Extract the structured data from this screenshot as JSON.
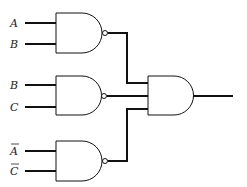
{
  "diagram": {
    "type": "logic-circuit",
    "gates": [
      {
        "id": "g1",
        "type": "NAND",
        "inputs": [
          "A",
          "B"
        ]
      },
      {
        "id": "g2",
        "type": "NAND",
        "inputs": [
          "B",
          "C"
        ]
      },
      {
        "id": "g3",
        "type": "NAND",
        "inputs": [
          "A̅",
          "C̅"
        ]
      },
      {
        "id": "g4",
        "type": "AND",
        "inputs": [
          "g1",
          "g2",
          "g3"
        ]
      }
    ],
    "labels": {
      "in1": "A",
      "in2": "B",
      "in3": "B",
      "in4": "C",
      "in5": "A",
      "in6": "C"
    },
    "overlined": [
      "in5",
      "in6"
    ],
    "colors": {
      "line": "#111111",
      "background": "#ffffff"
    }
  }
}
